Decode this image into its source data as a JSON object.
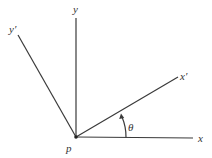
{
  "diagram": {
    "title": "",
    "origin": {
      "label": "p",
      "x": 76,
      "y": 137
    },
    "axes": [
      {
        "id": "x",
        "label": "x",
        "x2": 193,
        "y2": 138,
        "label_x": 198,
        "label_y": 142
      },
      {
        "id": "y",
        "label": "y",
        "x2": 76,
        "y2": 18,
        "label_x": 73,
        "label_y": 13
      },
      {
        "id": "x-prime",
        "label": "x′",
        "x2": 178,
        "y2": 77,
        "label_x": 181,
        "label_y": 78
      },
      {
        "id": "y-prime",
        "label": "y′",
        "x2": 18,
        "y2": 35,
        "label_x": 10,
        "label_y": 33
      }
    ],
    "angle": {
      "label": "θ",
      "from": "x",
      "to": "x′",
      "radius": 50
    },
    "colors": {
      "line": "#3a3a3a",
      "text": "#333333",
      "background": "#ffffff"
    }
  }
}
